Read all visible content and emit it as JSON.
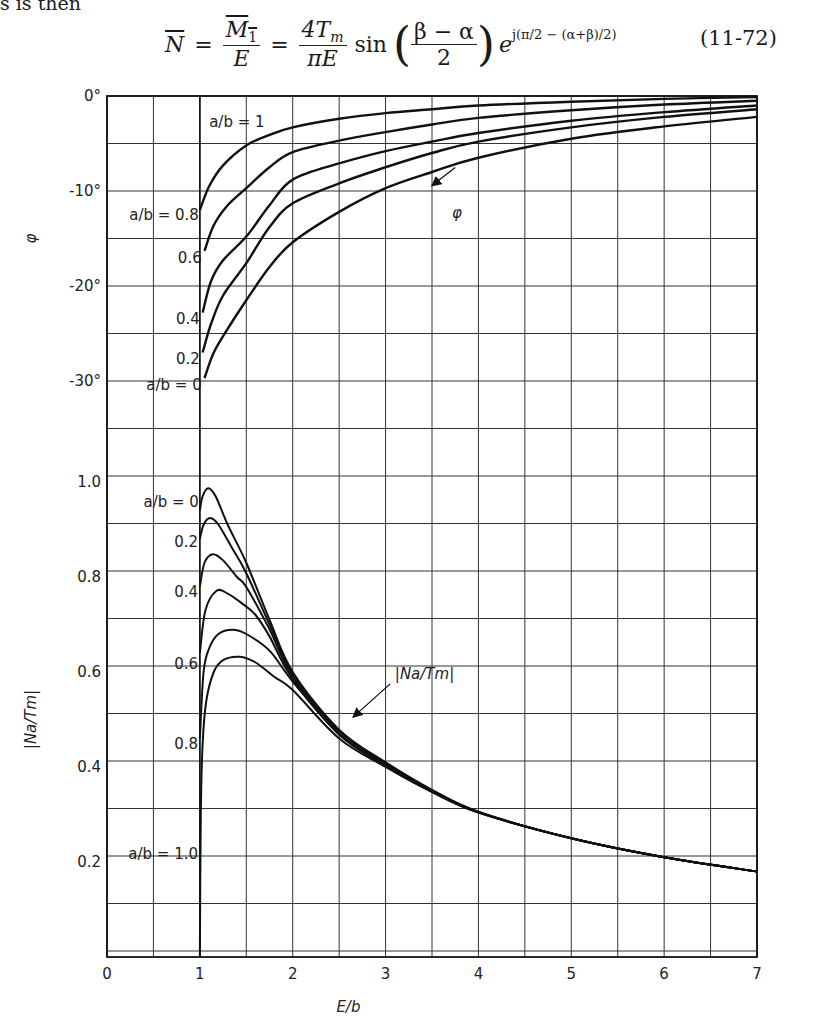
{
  "page": {
    "lead_text": "s is then",
    "equation": {
      "lhs": "N",
      "frac1_num": "M",
      "frac1_num_sub": "1",
      "frac1_den": "E",
      "frac2_num": "4T",
      "frac2_num_sub": "m",
      "frac2_den": "πE",
      "func": "sin",
      "arg_num": "β − α",
      "arg_den": "2",
      "exp_base": "e",
      "exp_text": "j(π/2 − (α+β)/2)",
      "number": "(11-72)"
    }
  },
  "chart_data": [
    {
      "type": "line",
      "panel": "phase",
      "ylabel": "φ",
      "xlabel": "",
      "xlim": [
        0,
        7
      ],
      "ylim": [
        -40,
        0
      ],
      "y_unit": "degrees",
      "yticks": [
        {
          "v": 0,
          "label": "0°"
        },
        {
          "v": -10,
          "label": "-10°"
        },
        {
          "v": -20,
          "label": "-20°"
        },
        {
          "v": -30,
          "label": "-30°"
        }
      ],
      "grid": true,
      "annotation": {
        "text": "φ",
        "arrow_to": [
          3.5,
          -8.8
        ]
      },
      "series": [
        {
          "name": "a/b = 1",
          "label": "a/b = 1",
          "x": [
            1,
            7
          ],
          "y": [
            0,
            0
          ]
        },
        {
          "name": "a/b = 0.8",
          "label": "a/b = 0.8",
          "x": [
            1.0,
            1.1,
            1.25,
            1.5,
            1.75,
            2,
            2.5,
            3,
            3.5,
            4,
            5,
            6,
            7
          ],
          "y": [
            -12.0,
            -9.5,
            -7.3,
            -5.2,
            -4.1,
            -3.3,
            -2.4,
            -1.8,
            -1.4,
            -1.0,
            -0.6,
            -0.3,
            -0.1
          ]
        },
        {
          "name": "a/b = 0.6",
          "label": "0.6",
          "x": [
            1.05,
            1.15,
            1.3,
            1.5,
            1.75,
            2,
            2.5,
            3,
            3.5,
            4,
            5,
            6,
            7
          ],
          "y": [
            -16.3,
            -13.6,
            -11.5,
            -9.7,
            -7.5,
            -5.9,
            -4.7,
            -3.8,
            -3.0,
            -2.3,
            -1.5,
            -0.9,
            -0.5
          ]
        },
        {
          "name": "a/b = 0.4",
          "label": "0.4",
          "x": [
            1.03,
            1.12,
            1.25,
            1.5,
            1.75,
            2,
            2.5,
            3,
            3.5,
            4,
            5,
            6,
            7
          ],
          "y": [
            -22.8,
            -19.5,
            -17.3,
            -14.8,
            -11.5,
            -8.8,
            -7.1,
            -5.8,
            -4.8,
            -3.9,
            -2.6,
            -1.7,
            -1.0
          ]
        },
        {
          "name": "a/b = 0.2",
          "label": "0.2",
          "x": [
            1.03,
            1.12,
            1.25,
            1.5,
            1.75,
            2,
            2.5,
            3,
            3.5,
            4,
            5,
            6,
            7
          ],
          "y": [
            -27.0,
            -24.0,
            -21.0,
            -17.6,
            -13.8,
            -11.3,
            -9.2,
            -7.5,
            -6.0,
            -4.8,
            -3.3,
            -2.2,
            -1.4
          ]
        },
        {
          "name": "a/b = 0",
          "label": "a/b = 0",
          "x": [
            1.05,
            1.15,
            1.3,
            1.5,
            1.75,
            2,
            2.5,
            3,
            3.5,
            4,
            5,
            6,
            7
          ],
          "y": [
            -29.7,
            -27.0,
            -24.5,
            -21.5,
            -18.0,
            -15.4,
            -12.2,
            -9.7,
            -8.0,
            -6.5,
            -4.5,
            -3.2,
            -2.2
          ]
        }
      ]
    },
    {
      "type": "line",
      "panel": "magnitude",
      "ylabel": "|Na/Tm|",
      "xlabel": "E/b",
      "xlim": [
        0,
        7
      ],
      "ylim": [
        0,
        1.1
      ],
      "xticks": [
        {
          "v": 0,
          "label": "0"
        },
        {
          "v": 1,
          "label": "1"
        },
        {
          "v": 2,
          "label": "2"
        },
        {
          "v": 3,
          "label": "3"
        },
        {
          "v": 4,
          "label": "4"
        },
        {
          "v": 5,
          "label": "5"
        },
        {
          "v": 6,
          "label": "6"
        },
        {
          "v": 7,
          "label": "7"
        }
      ],
      "yticks": [
        {
          "v": 0.2,
          "label": "0.2"
        },
        {
          "v": 0.4,
          "label": "0.4"
        },
        {
          "v": 0.6,
          "label": "0.6"
        },
        {
          "v": 0.8,
          "label": "0.8"
        },
        {
          "v": 1.0,
          "label": "1.0"
        }
      ],
      "grid": true,
      "annotation": {
        "text": "|Na/Tm|",
        "arrow_to": [
          2.4,
          0.5
        ]
      },
      "series": [
        {
          "name": "a/b = 0",
          "label": "a/b = 0",
          "x": [
            1.0,
            1.03,
            1.09,
            1.17,
            1.3,
            1.5,
            1.75,
            2,
            2.5,
            3,
            3.5,
            4,
            5,
            6,
            7
          ],
          "y": [
            0.94,
            0.97,
            0.987,
            0.97,
            0.91,
            0.83,
            0.71,
            0.6,
            0.478,
            0.41,
            0.352,
            0.306,
            0.25,
            0.21,
            0.18
          ]
        },
        {
          "name": "a/b = 0.2",
          "label": "0.2",
          "x": [
            1.0,
            1.04,
            1.11,
            1.2,
            1.35,
            1.5,
            1.75,
            2,
            2.5,
            3,
            3.5,
            4,
            5,
            6,
            7
          ],
          "y": [
            0.88,
            0.91,
            0.924,
            0.91,
            0.86,
            0.808,
            0.7,
            0.596,
            0.478,
            0.408,
            0.351,
            0.305,
            0.25,
            0.21,
            0.18
          ]
        },
        {
          "name": "a/b = 0.4",
          "label": "0.4",
          "x": [
            1.0,
            1.05,
            1.14,
            1.25,
            1.4,
            1.5,
            1.75,
            2,
            2.5,
            3,
            3.5,
            4,
            5,
            6,
            7
          ],
          "y": [
            0.78,
            0.83,
            0.848,
            0.835,
            0.8,
            0.779,
            0.69,
            0.59,
            0.475,
            0.406,
            0.35,
            0.305,
            0.25,
            0.21,
            0.18
          ]
        },
        {
          "name": "a/b = 0.6",
          "label": "0.6",
          "x": [
            1.0,
            1.06,
            1.18,
            1.3,
            1.45,
            1.6,
            1.75,
            2,
            2.5,
            3,
            3.5,
            4,
            5,
            6,
            7
          ],
          "y": [
            0.64,
            0.73,
            0.771,
            0.765,
            0.745,
            0.72,
            0.675,
            0.585,
            0.47,
            0.404,
            0.349,
            0.305,
            0.25,
            0.21,
            0.18
          ]
        },
        {
          "name": "a/b = 0.8",
          "label": "0.8",
          "x": [
            1.0,
            1.04,
            1.1,
            1.2,
            1.35,
            1.5,
            1.75,
            2,
            2.5,
            3,
            3.5,
            4,
            5,
            6,
            7
          ],
          "y": [
            0.46,
            0.6,
            0.65,
            0.68,
            0.689,
            0.68,
            0.645,
            0.58,
            0.468,
            0.402,
            0.348,
            0.304,
            0.25,
            0.21,
            0.18
          ]
        },
        {
          "name": "a/b = 1.0",
          "label": "a/b = 1.0",
          "x": [
            1.0,
            1.01,
            1.03,
            1.07,
            1.15,
            1.25,
            1.43,
            1.6,
            1.8,
            2,
            2.5,
            3,
            3.5,
            4,
            5,
            6,
            7
          ],
          "y": [
            0.0,
            0.3,
            0.45,
            0.54,
            0.6,
            0.625,
            0.632,
            0.62,
            0.59,
            0.562,
            0.46,
            0.4,
            0.347,
            0.304,
            0.25,
            0.21,
            0.18
          ]
        }
      ]
    }
  ]
}
